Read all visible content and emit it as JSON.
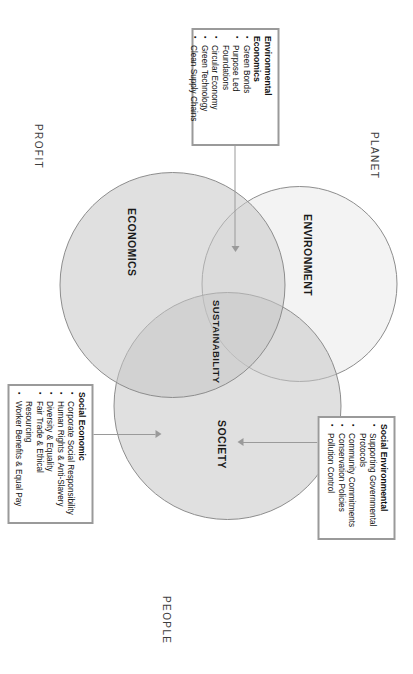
{
  "diagram": {
    "circles": [
      {
        "id": "environment",
        "label": "ENVIRONMENT",
        "fill": "#e8e8e8",
        "stroke": "#8d8d8d"
      },
      {
        "id": "society",
        "label": "SOCIETY",
        "fill": "#d9d9d9",
        "stroke": "#8d8d8d"
      },
      {
        "id": "economics",
        "label": "ECONOMICS",
        "fill": "#d9d9d9",
        "stroke": "#8d8d8d"
      }
    ],
    "intersection_label": "SUSTAINABILITY",
    "outer_words": {
      "planet": "PLANET",
      "people": "PEOPLE",
      "profit": "PROFIT"
    },
    "callouts": [
      {
        "id": "social-environmental",
        "title": "Social Environmental",
        "items": [
          "Supporting Governmental Protocols",
          "Community Commitments",
          "Conservation Policies",
          "Pollution Control"
        ]
      },
      {
        "id": "environmental-economics",
        "title": "Environmental Economics",
        "items": [
          "Green Bonds",
          "Purpose Led Foundations",
          "Circular Economy",
          "Green Technology",
          "Clean Supply Chains"
        ]
      },
      {
        "id": "social-economic",
        "title": "Social Economic",
        "items": [
          "Corporate Social Responsibility",
          "Human Rights & Anti-Slavery",
          "Diversity & Equality",
          "Fair Trade & Ethical Resourcing",
          "Worker Benefits & Equal Pay"
        ]
      }
    ],
    "colors": {
      "box_border": "#9a9a9a",
      "circle_stroke": "#8d8d8d",
      "connector": "#9a9a9a",
      "text": "#111111",
      "outer_word_text": "#3d3d3d",
      "background": "#ffffff"
    }
  }
}
